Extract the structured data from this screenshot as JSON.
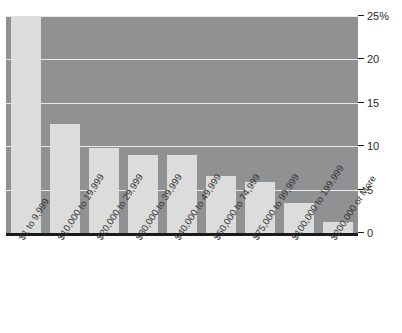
{
  "chart_data": {
    "type": "bar",
    "title": "",
    "subtitle": "",
    "xlabel": "",
    "ylabel": "",
    "ylim": [
      0,
      25
    ],
    "grid": true,
    "legend": false,
    "categories": [
      "$1 to 9,999",
      "$10,000 to 19,999",
      "$20,000 to 29,999",
      "$30,000 to 39,999",
      "$40,000 to 49,999",
      "$50,000 to 74,999",
      "$75,000 to 99,999",
      "$100,000 to 199,999",
      "$200,000 or More"
    ],
    "values": [
      25.0,
      12.6,
      9.8,
      9.0,
      9.0,
      6.6,
      5.9,
      3.5,
      1.3
    ],
    "yticks": [
      {
        "value": 25,
        "label": "25%"
      },
      {
        "value": 20,
        "label": "20"
      },
      {
        "value": 15,
        "label": "15"
      },
      {
        "value": 10,
        "label": "10"
      },
      {
        "value": 5,
        "label": "5"
      },
      {
        "value": 0,
        "label": "0"
      }
    ],
    "colors": {
      "plot_background": "#8f9193",
      "bar_fill": "#dcdcdc",
      "gridline": "#e8e9ea",
      "axis": "#1a1a1a",
      "text": "#2b2b2b"
    }
  }
}
